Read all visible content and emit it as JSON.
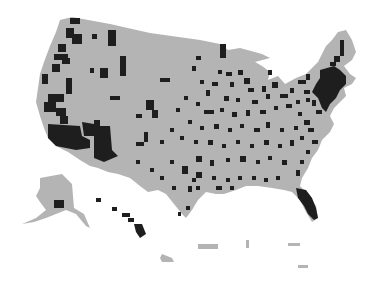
{
  "map": {
    "type": "choropleth",
    "region": "United States counties",
    "colors": {
      "background": "#ffffff",
      "land": "#b4b4b4",
      "highlight": "#1e1e1e"
    },
    "insets": [
      "alaska",
      "hawaii",
      "puerto-rico"
    ],
    "highlighted_clusters": [
      {
        "name": "california-coast",
        "x": 30,
        "y": 70
      },
      {
        "name": "southern-california",
        "x": 55,
        "y": 140
      },
      {
        "name": "arizona",
        "x": 100,
        "y": 160
      },
      {
        "name": "pacific-northwest",
        "x": 60,
        "y": 45
      },
      {
        "name": "northeast-corridor",
        "x": 340,
        "y": 90
      },
      {
        "name": "florida",
        "x": 308,
        "y": 200
      },
      {
        "name": "hawaii",
        "x": 140,
        "y": 225
      },
      {
        "name": "alaska-south",
        "x": 58,
        "y": 205
      }
    ]
  }
}
